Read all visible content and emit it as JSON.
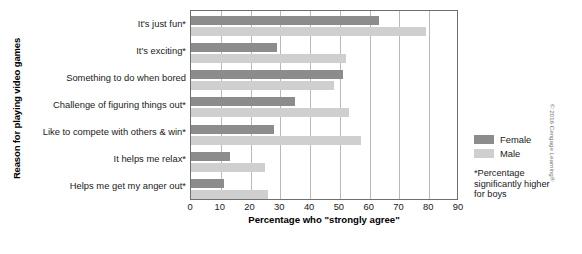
{
  "chart_data": {
    "type": "bar",
    "orientation": "horizontal",
    "title": "",
    "xlabel": "Percentage who \"strongly agree\"",
    "ylabel": "Reason for playing video games",
    "xlim": [
      0,
      90
    ],
    "xticks": [
      0,
      10,
      20,
      30,
      40,
      50,
      60,
      70,
      80,
      90
    ],
    "grid": "vertical",
    "legend_position": "right",
    "categories": [
      "It's just fun*",
      "It's exciting*",
      "Something to do when bored",
      "Challenge of figuring things out*",
      "Like to compete with others & win*",
      "It helps me relax*",
      "Helps me get my anger out*"
    ],
    "series": [
      {
        "name": "Female",
        "color": "#8c8c8c",
        "values": [
          63,
          29,
          51,
          35,
          28,
          13,
          11
        ]
      },
      {
        "name": "Male",
        "color": "#cfcfcf",
        "values": [
          79,
          52,
          48,
          53,
          57,
          25,
          26
        ]
      }
    ],
    "annotations": [
      "*Percentage significantly higher for boys"
    ]
  },
  "legend": {
    "items": [
      {
        "label": "Female"
      },
      {
        "label": "Male"
      }
    ]
  },
  "footnote": {
    "line1": "*Percentage",
    "line2": "significantly higher",
    "line3": "for boys"
  },
  "credit": {
    "text": "© 2016 Cengage Learning®"
  },
  "colors": {
    "female": "#8c8c8c",
    "male": "#cfcfcf",
    "grid": "#b9b9b9",
    "frame": "#6f6f6f"
  }
}
